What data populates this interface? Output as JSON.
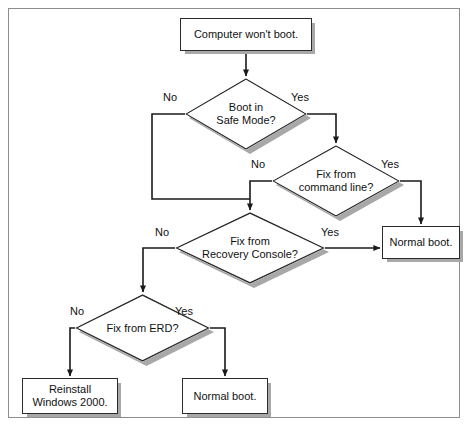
{
  "diagram": {
    "type": "flowchart",
    "colors": {
      "node_fill": "#ffffff",
      "node_stroke": "#2b2b2b",
      "shadow": "#a8a8a8",
      "connector": "#1a1a1a",
      "frame": "#8d8d8d",
      "text": "#111111"
    },
    "nodes": [
      {
        "id": "start",
        "shape": "box",
        "label": "Computer won't boot.",
        "x": 180,
        "y": 18,
        "w": 132,
        "h": 33
      },
      {
        "id": "safe-mode",
        "shape": "diamond",
        "label": "Boot in\nSafe Mode?",
        "x": 185,
        "y": 78,
        "w": 122,
        "h": 72
      },
      {
        "id": "command-line",
        "shape": "diamond",
        "label": "Fix from\ncommand line?",
        "x": 272,
        "y": 145,
        "w": 128,
        "h": 72
      },
      {
        "id": "recovery-console",
        "shape": "diamond",
        "label": "Fix from\nRecovery Console?",
        "x": 175,
        "y": 212,
        "w": 150,
        "h": 72
      },
      {
        "id": "erd",
        "shape": "diamond",
        "label": "Fix from ERD?",
        "x": 75,
        "y": 294,
        "w": 135,
        "h": 68
      },
      {
        "id": "normal-boot-right",
        "shape": "box",
        "label": "Normal boot.",
        "x": 382,
        "y": 226,
        "w": 78,
        "h": 33
      },
      {
        "id": "reinstall",
        "shape": "box",
        "label": "Reinstall\nWindows 2000.",
        "x": 22,
        "y": 378,
        "w": 96,
        "h": 36
      },
      {
        "id": "normal-boot-bottom",
        "shape": "box",
        "label": "Normal boot.",
        "x": 182,
        "y": 378,
        "w": 86,
        "h": 36
      }
    ],
    "edge_labels": [
      {
        "id": "safe-mode-no",
        "text": "No",
        "x": 163,
        "y": 91
      },
      {
        "id": "safe-mode-yes",
        "text": "Yes",
        "x": 291,
        "y": 91
      },
      {
        "id": "command-line-no",
        "text": "No",
        "x": 251,
        "y": 158
      },
      {
        "id": "command-line-yes",
        "text": "Yes",
        "x": 381,
        "y": 158
      },
      {
        "id": "recovery-no",
        "text": "No",
        "x": 155,
        "y": 226
      },
      {
        "id": "recovery-yes",
        "text": "Yes",
        "x": 321,
        "y": 226
      },
      {
        "id": "erd-no",
        "text": "No",
        "x": 70,
        "y": 305
      },
      {
        "id": "erd-yes",
        "text": "Yes",
        "x": 175,
        "y": 305
      }
    ],
    "edges": [
      {
        "id": "start-to-safe-mode",
        "from": "start",
        "to": "safe-mode",
        "label": ""
      },
      {
        "id": "safe-mode-yes-to-command-line",
        "from": "safe-mode",
        "to": "command-line",
        "label": "Yes"
      },
      {
        "id": "safe-mode-no-to-recovery",
        "from": "safe-mode",
        "to": "recovery-console",
        "label": "No"
      },
      {
        "id": "command-line-no-to-recovery",
        "from": "command-line",
        "to": "recovery-console",
        "label": "No"
      },
      {
        "id": "command-line-yes-to-normal",
        "from": "command-line",
        "to": "normal-boot-right",
        "label": "Yes"
      },
      {
        "id": "recovery-yes-to-normal",
        "from": "recovery-console",
        "to": "normal-boot-right",
        "label": "Yes"
      },
      {
        "id": "recovery-no-to-erd",
        "from": "recovery-console",
        "to": "erd",
        "label": "No"
      },
      {
        "id": "erd-no-to-reinstall",
        "from": "erd",
        "to": "reinstall",
        "label": "No"
      },
      {
        "id": "erd-yes-to-normal",
        "from": "erd",
        "to": "normal-boot-bottom",
        "label": "Yes"
      }
    ]
  }
}
